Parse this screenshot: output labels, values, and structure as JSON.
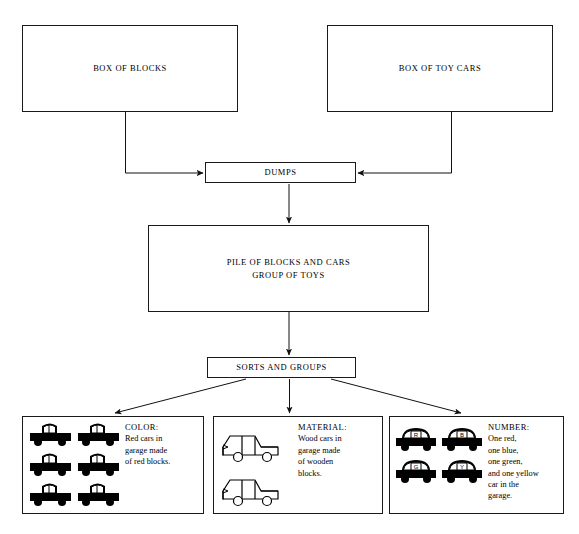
{
  "diagram": {
    "stroke_color": "#1a1a1a",
    "fill_color": "#ffffff",
    "icon_color": "#000000",
    "nodes": {
      "box_of_blocks": {
        "label": "BOX OF BLOCKS"
      },
      "box_of_toy_cars": {
        "label": "BOX OF TOY CARS"
      },
      "dumps": {
        "label": "DUMPS"
      },
      "pile": {
        "label": "PILE OF BLOCKS AND CARS\nGROUP OF TOYS"
      },
      "sorts": {
        "label": "SORTS AND GROUPS"
      }
    },
    "attributes": [
      {
        "key": "color",
        "title": "COLOR:",
        "body": "Red cars in\ngarage made\nof red blocks.",
        "icon": "filled-pickup-truck-icon",
        "icon_count": 6,
        "icon_style": "solid-black",
        "icon_labels": []
      },
      {
        "key": "material",
        "title": "MATERIAL:",
        "body": "Wood cars in\ngarage made\nof wooden\nblocks.",
        "icon": "outline-pickup-truck-icon",
        "icon_count": 2,
        "icon_style": "outline",
        "icon_labels": []
      },
      {
        "key": "number",
        "title": "NUMBER:",
        "body": "One red,\none blue,\none green,\nand one yellow\ncar in the\ngarage.",
        "icon": "filled-car-with-letter-icon",
        "icon_count": 4,
        "icon_style": "solid-black-lettered",
        "icon_labels": [
          "R",
          "B",
          "G",
          "Y"
        ]
      }
    ],
    "edges": [
      {
        "from": "box_of_blocks",
        "to": "dumps",
        "style": "elbow-right-arrow"
      },
      {
        "from": "box_of_toy_cars",
        "to": "dumps",
        "style": "elbow-left-arrow"
      },
      {
        "from": "dumps",
        "to": "pile",
        "style": "straight-down-arrow"
      },
      {
        "from": "pile",
        "to": "sorts",
        "style": "straight-down-arrow"
      },
      {
        "from": "sorts",
        "to": "color",
        "style": "diagonal-down-left-arrow"
      },
      {
        "from": "sorts",
        "to": "material",
        "style": "straight-down-arrow"
      },
      {
        "from": "sorts",
        "to": "number",
        "style": "diagonal-down-right-arrow"
      }
    ]
  }
}
